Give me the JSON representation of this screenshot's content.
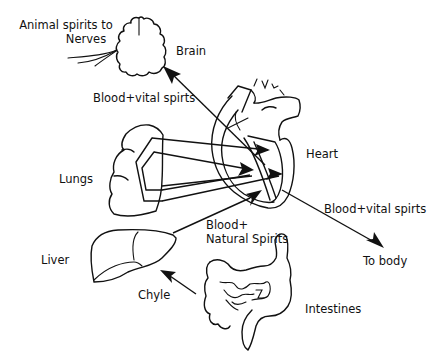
{
  "diagram": {
    "organs": [
      {
        "id": "brain",
        "label": "Brain"
      },
      {
        "id": "heart",
        "label": "Heart"
      },
      {
        "id": "lungs",
        "label": "Lungs"
      },
      {
        "id": "liver",
        "label": "Liver"
      },
      {
        "id": "intestines",
        "label": "Intestines"
      }
    ],
    "labels": {
      "animal_spirits_line1": "Animal spirits to",
      "animal_spirits_line2": "Nerves",
      "brain": "Brain",
      "blood_vital_brain": "Blood+vital spirts",
      "heart": "Heart",
      "lungs": "Lungs",
      "blood_vital_body": "Blood+vital spirts",
      "blood_natural_line1": "Blood+",
      "blood_natural_line2": "Natural Spirits",
      "liver": "Liver",
      "to_body": "To body",
      "chyle": "Chyle",
      "intestines": "Intestines"
    },
    "flows": [
      {
        "from": "heart",
        "to": "brain",
        "label": "Blood+vital spirts"
      },
      {
        "from": "lungs",
        "to": "heart",
        "label": ""
      },
      {
        "from": "liver",
        "to": "heart",
        "label": "Blood+ Natural Spirits"
      },
      {
        "from": "heart",
        "to": "body",
        "label": "Blood+vital spirts"
      },
      {
        "from": "intestines",
        "to": "liver",
        "label": "Chyle"
      },
      {
        "from": "brain",
        "to": "nerves",
        "label": "Animal spirits to Nerves"
      }
    ],
    "colors": {
      "line": "#111111",
      "background": "#ffffff"
    }
  }
}
